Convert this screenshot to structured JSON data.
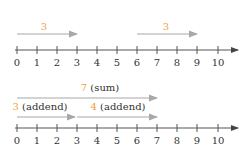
{
  "colors": {
    "axis": "#555555",
    "arrow": "#a8a8a8",
    "number_accent": "#f0a040",
    "label": "#333333"
  },
  "top_diagram": {
    "axis_ticks": [
      "0",
      "1",
      "2",
      "3",
      "4",
      "5",
      "6",
      "7",
      "8",
      "9",
      "10"
    ],
    "arrows": [
      {
        "from": 0,
        "to": 3,
        "number": "3",
        "suffix": ""
      },
      {
        "from": 6,
        "to": 9,
        "number": "3",
        "suffix": ""
      }
    ]
  },
  "bottom_diagram": {
    "axis_ticks": [
      "0",
      "1",
      "2",
      "3",
      "4",
      "5",
      "6",
      "7",
      "8",
      "9",
      "10"
    ],
    "sum_arrow": {
      "from": 0,
      "to": 7,
      "number": "7",
      "suffix": " (sum)"
    },
    "addend_arrows": [
      {
        "from": 0,
        "to": 3,
        "number": "3",
        "suffix": " (addend)"
      },
      {
        "from": 3,
        "to": 7,
        "number": "4",
        "suffix": " (addend)"
      }
    ]
  }
}
